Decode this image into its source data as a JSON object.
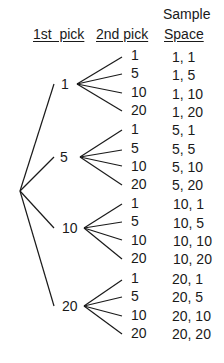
{
  "headers": {
    "first_pick": "1st  pick",
    "second_pick": "2nd pick",
    "sample_space_line1": "Sample",
    "sample_space_line2": "Space"
  },
  "first_picks": [
    {
      "label": "1",
      "second": [
        "1",
        "5",
        "10",
        "20"
      ],
      "outcomes": [
        "1, 1",
        "1, 5",
        "1, 10",
        "1, 20"
      ]
    },
    {
      "label": "5",
      "second": [
        "1",
        "5",
        "10",
        "20"
      ],
      "outcomes": [
        "5, 1",
        "5, 5",
        "5, 10",
        "5, 20"
      ]
    },
    {
      "label": "10",
      "second": [
        "1",
        "5",
        "10",
        "20"
      ],
      "outcomes": [
        "10, 1",
        "10, 5",
        "10, 10",
        "10, 20"
      ]
    },
    {
      "label": "20",
      "second": [
        "1",
        "5",
        "10",
        "20"
      ],
      "outcomes": [
        "20, 1",
        "20, 5",
        "20, 10",
        "20, 20"
      ]
    }
  ],
  "colors": {
    "line": "#1a1a1a",
    "text": "#1a1a1a",
    "background": "#ffffff"
  }
}
